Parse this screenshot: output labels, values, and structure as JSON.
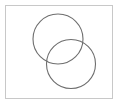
{
  "diagram": {
    "type": "venn",
    "sets": [
      {
        "name": "set-a",
        "label": ""
      },
      {
        "name": "set-b",
        "label": ""
      }
    ],
    "colors": {
      "frame": "#c8c8c8",
      "circle_stroke": "#6e6e6e",
      "background": "#ffffff"
    }
  }
}
